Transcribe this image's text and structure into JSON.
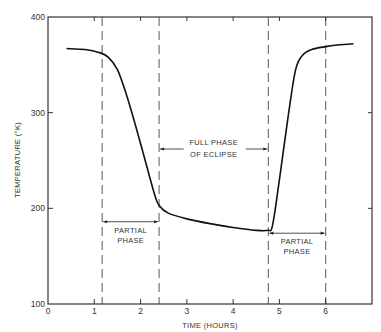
{
  "chart_data": {
    "type": "line",
    "title": "",
    "xlabel": "TIME (HOURS)",
    "ylabel": "TEMPERATURE (°K)",
    "xlim": [
      0,
      7
    ],
    "ylim": [
      100,
      400
    ],
    "x_ticks": [
      0,
      1,
      2,
      3,
      4,
      5,
      6
    ],
    "x_tick_labels": [
      "0",
      "1",
      "2",
      "3",
      "4",
      "5",
      "6"
    ],
    "y_ticks": [
      100,
      200,
      300,
      400
    ],
    "y_tick_labels": [
      "100",
      "200",
      "300",
      "400"
    ],
    "grid": false,
    "legend": "none",
    "series": [
      {
        "name": "Temperature",
        "x": [
          0.4,
          0.8,
          1.1,
          1.3,
          1.5,
          1.7,
          1.9,
          2.1,
          2.3,
          2.4,
          2.6,
          3.0,
          3.5,
          4.0,
          4.5,
          4.75,
          4.85,
          5.0,
          5.2,
          5.35,
          5.5,
          5.7,
          6.0,
          6.3,
          6.6
        ],
        "y": [
          367,
          366,
          363,
          358,
          345,
          318,
          285,
          250,
          215,
          203,
          195,
          189,
          184,
          180,
          177,
          177,
          182,
          230,
          300,
          345,
          360,
          366,
          369,
          371,
          372
        ]
      }
    ],
    "phase_markers_x": [
      1.17,
      2.4,
      4.76,
      6.0
    ],
    "annotations": [
      {
        "lines": [
          "PARTIAL",
          "PHASE"
        ],
        "x_range": [
          1.17,
          2.4
        ],
        "arrow_y": 186
      },
      {
        "lines": [
          "FULL PHASE",
          "OF ECLIPSE"
        ],
        "x_range": [
          2.4,
          4.76
        ],
        "arrow_y": 262
      },
      {
        "lines": [
          "PARTIAL",
          "PHASE"
        ],
        "x_range": [
          4.76,
          6.0
        ],
        "arrow_y": 174
      }
    ]
  }
}
